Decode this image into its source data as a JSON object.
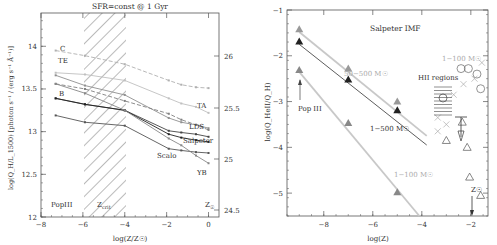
{
  "chart_data": [
    {
      "type": "line",
      "title": "SFR=const @ 1 Gyr",
      "xlabel": "log(Z/Z☉)",
      "ylabel": "log(Q_H/L_1500) [photon s⁻¹ / (erg s⁻¹ Å⁻¹)]",
      "xlim": [
        -8,
        0.5
      ],
      "ylim": [
        12,
        14.39
      ],
      "x_ticks": [
        "-8",
        "-6",
        "-4",
        "-2",
        "0"
      ],
      "y_ticks": [
        "12",
        "12.5",
        "13",
        "13.5",
        "14"
      ],
      "y2_ticks": [
        "24.5",
        "25",
        "25.5",
        "26"
      ],
      "grid": false,
      "shaded_region": {
        "x_from": -6,
        "x_to": -4,
        "label": "Z_crit",
        "style": "hatched"
      },
      "annotations": [
        "PopIII",
        "Z_crit",
        "Z☉"
      ],
      "x": [
        -7.3,
        -5.9,
        -4.0,
        -1.9,
        -1.3,
        -0.6,
        0.0
      ],
      "series": [
        {
          "name": "C",
          "style": "dashed",
          "color": "#b0b0b0",
          "values": [
            13.95,
            13.89,
            13.79,
            13.6,
            13.55,
            13.52,
            13.51
          ]
        },
        {
          "name": "TE",
          "style": "solid",
          "color": "#c0c0c0",
          "values": [
            13.69,
            13.67,
            13.6,
            13.39,
            13.33,
            13.29,
            13.22
          ]
        },
        {
          "name": "TA",
          "style": "solid",
          "color": "#909090",
          "values": [
            13.66,
            13.54,
            13.43,
            13.16,
            13.11,
            13.08,
            13.04
          ]
        },
        {
          "name": "LDS",
          "style": "dashed",
          "color": "#808080",
          "values": [
            13.56,
            13.5,
            13.36,
            13.21,
            13.14,
            13.08,
            13.02
          ]
        },
        {
          "name": "B",
          "style": "solid",
          "color": "#444444",
          "values": [
            13.39,
            13.32,
            13.25,
            13.01,
            12.99,
            12.97,
            12.94
          ]
        },
        {
          "name": "Salpeter",
          "style": "solid",
          "color": "#222222",
          "values": [
            13.39,
            13.32,
            13.25,
            12.97,
            12.93,
            12.9,
            12.88
          ]
        },
        {
          "name": "Scalo",
          "style": "solid",
          "color": "#555555",
          "values": [
            13.19,
            13.11,
            13.07,
            12.8,
            12.78,
            12.76,
            12.75
          ]
        },
        {
          "name": "YB",
          "style": "solid",
          "color": "#888888",
          "values": [
            13.56,
            13.45,
            13.25,
            12.92,
            12.84,
            12.72,
            12.63
          ]
        }
      ]
    },
    {
      "type": "scatter",
      "title": "Salpeter IMF",
      "xlabel": "log(Z)",
      "ylabel": "log(Q_HeII/Q_H)",
      "xlim": [
        -9.5,
        -1.3
      ],
      "ylim": [
        -5.5,
        -1
      ],
      "x_ticks": [
        "-8",
        "-6",
        "-4",
        "-2"
      ],
      "y_ticks": [
        "-1",
        "-2",
        "-3",
        "-4",
        "-5"
      ],
      "grid": false,
      "series": [
        {
          "name": "50-500 M☉",
          "marker": "triangle",
          "color": "#999999",
          "x": [
            -9,
            -7,
            -5
          ],
          "y": [
            -1.42,
            -2.28,
            -3.0
          ],
          "fit_line": [
            [
              -9,
              -1.48
            ],
            [
              -3.8,
              -3.75
            ]
          ]
        },
        {
          "name": "1-500 M☉",
          "marker": "triangle",
          "color": "#222222",
          "x": [
            -9,
            -7,
            -5
          ],
          "y": [
            -1.69,
            -2.52,
            -3.19
          ],
          "fit_line": [
            [
              -9,
              -1.75
            ],
            [
              -3.8,
              -3.95
            ]
          ]
        },
        {
          "name": "1-100 M☉",
          "marker": "triangle",
          "color": "#888888",
          "x": [
            -9,
            -7,
            -5
          ],
          "y": [
            -2.31,
            -3.47,
            -4.98
          ],
          "fit_line": [
            [
              -9,
              -2.35
            ],
            [
              -4.1,
              -5.5
            ]
          ]
        }
      ],
      "observations": {
        "label": "HII regions",
        "circles": [
          [
            -2.4,
            -2.28
          ],
          [
            -2.1,
            -2.28
          ],
          [
            -1.75,
            -2.4
          ],
          [
            -1.6,
            -2.72
          ]
        ],
        "crosses": [
          [
            -1.55,
            -2.15
          ],
          [
            -1.85,
            -2.5
          ],
          [
            -2.3,
            -2.62
          ],
          [
            -2.7,
            -2.85
          ],
          [
            -3.35,
            -3.35
          ],
          [
            -3.0,
            -3.5
          ],
          [
            -3.35,
            -3.65
          ]
        ],
        "triangles": [
          [
            -2.35,
            -3.45
          ],
          [
            -3.0,
            -3.85
          ],
          [
            -2.15,
            -4.0
          ],
          [
            -2.05,
            -4.65
          ],
          [
            -1.6,
            -5.05
          ]
        ]
      },
      "annotations": [
        "Pop III",
        "HII regions",
        "Z☉",
        "50-500 M☉",
        "1-500 M☉",
        "1-100 M☉",
        "1-100 M☉ (obs)"
      ]
    }
  ],
  "left": {
    "title": "SFR=const @ 1 Gyr",
    "xlabel": "log(Z/Z☉)",
    "ylabel": "log(Q_H/L_1500) [photon s⁻¹ / (erg s⁻¹ Å⁻¹)]",
    "labels": {
      "C": "C",
      "TE": "TE",
      "B": "B",
      "TA": "TA",
      "LDS": "LDS",
      "Salpeter": "Salpeter",
      "Scalo": "Scalo",
      "YB": "YB",
      "popiii": "PopIII",
      "zcrit": "Z",
      "zcrit_sub": "crit",
      "zsun": "Z",
      "zsun_sub": "☉"
    }
  },
  "right": {
    "title": "Salpeter IMF",
    "xlabel": "log(Z)",
    "ylabel": "log(Q_HeII/Q_H)",
    "labels": {
      "popiii": "Pop III",
      "hii": "HII regions",
      "m50_500": "50−500 M☉",
      "m1_500": "1−500 M☉",
      "m1_100": "1−100 M☉",
      "m1_100_obs": "1−100 M☉",
      "zsun": "Z☉"
    }
  }
}
